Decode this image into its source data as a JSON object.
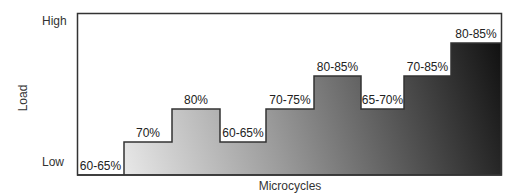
{
  "chart_data": {
    "type": "bar",
    "subtype": "step",
    "title": "",
    "xlabel": "Microcycles",
    "ylabel": "Load",
    "y_tick_labels": {
      "top": "High",
      "bottom": "Low"
    },
    "categories": [
      "1",
      "2",
      "3",
      "4",
      "5",
      "6",
      "7",
      "8",
      "9"
    ],
    "labels": [
      "60-65%",
      "70%",
      "80%",
      "60-65%",
      "70-75%",
      "80-85%",
      "65-70%",
      "70-85%",
      "80-85%"
    ],
    "values": [
      0,
      1,
      2,
      1,
      2,
      3,
      2,
      3,
      4
    ],
    "ylim": [
      0,
      4
    ],
    "grid": false,
    "legend": null,
    "fill": {
      "gradient_from": "#ffffff",
      "gradient_to": "#111111",
      "direction": "bottom-left to top-right"
    },
    "frame_color": "#333333"
  }
}
